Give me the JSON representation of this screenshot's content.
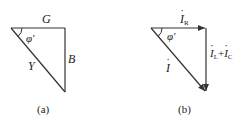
{
  "panels": [
    {
      "id": "a",
      "caption": "(a)",
      "labels": {
        "top": "G",
        "right": "B",
        "hypotenuse": "Y",
        "angle": "φ'"
      },
      "vertices": {
        "left": [
          11,
          28
        ],
        "right_top": [
          65,
          28
        ],
        "bottom": [
          65,
          92
        ]
      },
      "arrows": false
    },
    {
      "id": "b",
      "caption": "(b)",
      "labels": {
        "top_main": "I",
        "top_sub": "R",
        "right_main1": "I",
        "right_sub1": "L",
        "right_plus": "+",
        "right_main2": "I",
        "right_sub2": "C",
        "hypotenuse": "I",
        "angle": "φ'"
      },
      "vertices": {
        "left": [
          151,
          28
        ],
        "right_top": [
          206,
          28
        ],
        "bottom": [
          206,
          92
        ]
      },
      "arrows": true
    }
  ],
  "colors": {
    "line": "#333333",
    "background": "#ffffff"
  }
}
